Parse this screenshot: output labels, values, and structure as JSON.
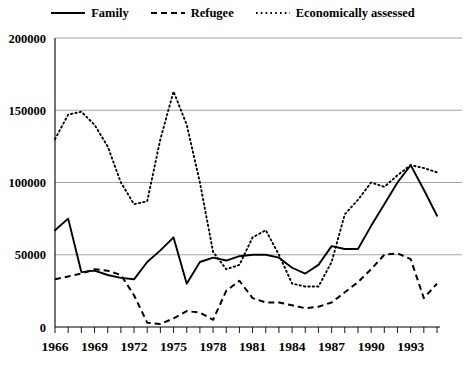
{
  "legend": {
    "position": "top-center",
    "entries": [
      {
        "label": "Family",
        "style": "solid",
        "icon": "solid-line-icon"
      },
      {
        "label": "Refugee",
        "style": "dashed",
        "icon": "dashed-line-icon"
      },
      {
        "label": "Economically assessed",
        "style": "dotted",
        "icon": "dotted-line-icon"
      }
    ]
  },
  "axes": {
    "y_ticks": [
      "0",
      "50000",
      "100000",
      "150000",
      "200000"
    ],
    "x_ticks": [
      "1966",
      "1969",
      "1972",
      "1975",
      "1978",
      "1981",
      "1984",
      "1987",
      "1990",
      "1993"
    ],
    "ylim": [
      0,
      200000
    ],
    "xlim": [
      1966,
      1995
    ],
    "grid": true
  },
  "colors": {
    "line": "#000000",
    "grid": "#9a9a9a",
    "axis": "#000000",
    "background": "#ffffff"
  },
  "chart_data": {
    "type": "line",
    "title": "",
    "xlabel": "",
    "ylabel": "",
    "xlim": [
      1966,
      1995
    ],
    "ylim": [
      0,
      200000
    ],
    "grid": true,
    "legend_position": "top-center",
    "x": [
      1966,
      1967,
      1968,
      1969,
      1970,
      1971,
      1972,
      1973,
      1974,
      1975,
      1976,
      1977,
      1978,
      1979,
      1980,
      1981,
      1982,
      1983,
      1984,
      1985,
      1986,
      1987,
      1988,
      1989,
      1990,
      1991,
      1992,
      1993,
      1994,
      1995
    ],
    "series": [
      {
        "name": "Family",
        "style": "solid",
        "values": [
          67000,
          75000,
          38000,
          39000,
          36000,
          34000,
          33000,
          45000,
          53000,
          62000,
          30000,
          45000,
          48000,
          46000,
          49000,
          50000,
          50000,
          48000,
          41000,
          37000,
          43000,
          56000,
          54000,
          54000,
          70000,
          85000,
          100000,
          112000,
          95000,
          77000
        ]
      },
      {
        "name": "Refugee",
        "style": "dashed",
        "values": [
          33000,
          35000,
          37000,
          40000,
          39000,
          36000,
          22000,
          3000,
          2000,
          6000,
          11000,
          10000,
          5000,
          25000,
          32000,
          20000,
          17000,
          17000,
          15000,
          13000,
          14000,
          17000,
          24000,
          31000,
          40000,
          50000,
          51000,
          47000,
          20000,
          30000
        ]
      },
      {
        "name": "Economically assessed",
        "style": "dotted",
        "values": [
          130000,
          147000,
          149000,
          140000,
          125000,
          100000,
          85000,
          87000,
          130000,
          163000,
          140000,
          100000,
          52000,
          40000,
          43000,
          62000,
          67000,
          50000,
          30000,
          28000,
          28000,
          45000,
          78000,
          88000,
          100000,
          97000,
          105000,
          112000,
          110000,
          107000
        ]
      }
    ]
  }
}
